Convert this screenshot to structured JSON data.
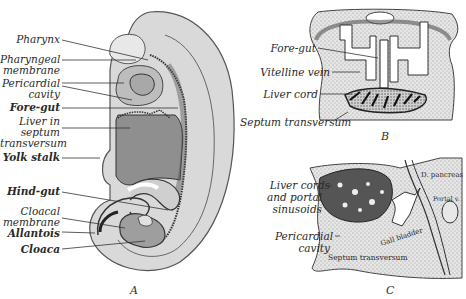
{
  "figure": {
    "panels": [
      {
        "id": "A",
        "letter": "A",
        "labels": [
          {
            "text": "Pharynx"
          },
          {
            "text": "Pharyngeal"
          },
          {
            "text": "membrane"
          },
          {
            "text": "Pericardial"
          },
          {
            "text": "cavity"
          },
          {
            "text": "Fore-gut"
          },
          {
            "text": "Liver in"
          },
          {
            "text": "septum"
          },
          {
            "text": "transversum"
          },
          {
            "text": "Yolk stalk"
          },
          {
            "text": "Hind-gut"
          },
          {
            "text": "Cloacal"
          },
          {
            "text": "membrane"
          },
          {
            "text": "Allantois"
          },
          {
            "text": "Cloaca"
          }
        ]
      },
      {
        "id": "B",
        "letter": "B",
        "labels": [
          {
            "text": "Fore-gut"
          },
          {
            "text": "Vitelline vein"
          },
          {
            "text": "Liver cord"
          },
          {
            "text": "Septum transversum"
          }
        ]
      },
      {
        "id": "C",
        "letter": "C",
        "labels": [
          {
            "text": "Liver cords"
          },
          {
            "text": "and portal"
          },
          {
            "text": "sinusoids"
          },
          {
            "text": "Pericardial"
          },
          {
            "text": "cavity"
          },
          {
            "text": "D. pancreas"
          },
          {
            "text": "Portal v."
          },
          {
            "text": "Gall bladder"
          },
          {
            "text": "Septum transversum"
          }
        ]
      }
    ]
  }
}
